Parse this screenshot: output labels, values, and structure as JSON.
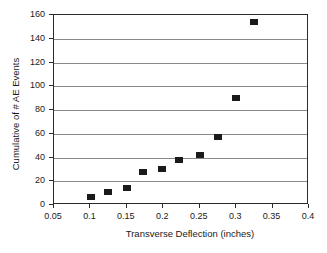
{
  "chart_data": {
    "type": "scatter",
    "title": "",
    "xlabel": "Transverse Deflection (inches)",
    "ylabel": "Cumulative of  # AE Events",
    "xlim": [
      0.05,
      0.4
    ],
    "ylim": [
      0,
      160
    ],
    "xticks": [
      "0.05",
      "0.1",
      "0.15",
      "0.2",
      "0.25",
      "0.3",
      "0.35",
      "0.4"
    ],
    "xtick_values": [
      0.05,
      0.1,
      0.15,
      0.2,
      0.25,
      0.3,
      0.35,
      0.4
    ],
    "yticks": [
      "0",
      "20",
      "40",
      "60",
      "80",
      "100",
      "120",
      "140",
      "160"
    ],
    "ytick_values": [
      0,
      20,
      40,
      60,
      80,
      100,
      120,
      140,
      160
    ],
    "grid": "horizontal",
    "legend": "none",
    "marker": "filled-square",
    "marker_color": "#1a1a1a",
    "series": [
      {
        "name": "Cumulative AE Events",
        "x": [
          0.101,
          0.124,
          0.15,
          0.172,
          0.198,
          0.222,
          0.25,
          0.275,
          0.3,
          0.325
        ],
        "y": [
          7,
          11,
          14,
          28,
          30,
          38,
          42,
          57,
          90,
          154
        ]
      }
    ]
  }
}
